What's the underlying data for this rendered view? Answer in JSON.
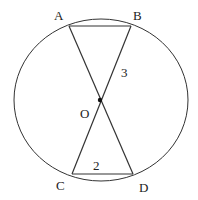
{
  "diagram": {
    "type": "geometry",
    "colors": {
      "stroke": "#333333",
      "background": "#ffffff",
      "text": "#222222"
    },
    "circle": {
      "cx": 101,
      "cy": 100,
      "rx": 87,
      "ry": 81
    },
    "points": {
      "A": {
        "label": "A",
        "x": 69,
        "y": 26,
        "lx": 54,
        "ly": 20
      },
      "B": {
        "label": "B",
        "x": 131,
        "y": 26,
        "lx": 133,
        "ly": 20
      },
      "C": {
        "label": "C",
        "x": 72,
        "y": 174,
        "lx": 56,
        "ly": 190
      },
      "D": {
        "label": "D",
        "x": 133,
        "y": 174,
        "lx": 139,
        "ly": 192
      },
      "O": {
        "label": "O",
        "x": 100,
        "y": 100,
        "lx": 80,
        "ly": 118
      }
    },
    "segment_labels": {
      "OB": {
        "text": "3",
        "x": 121,
        "y": 77
      },
      "CD": {
        "text": "2",
        "x": 93,
        "y": 170
      }
    }
  }
}
